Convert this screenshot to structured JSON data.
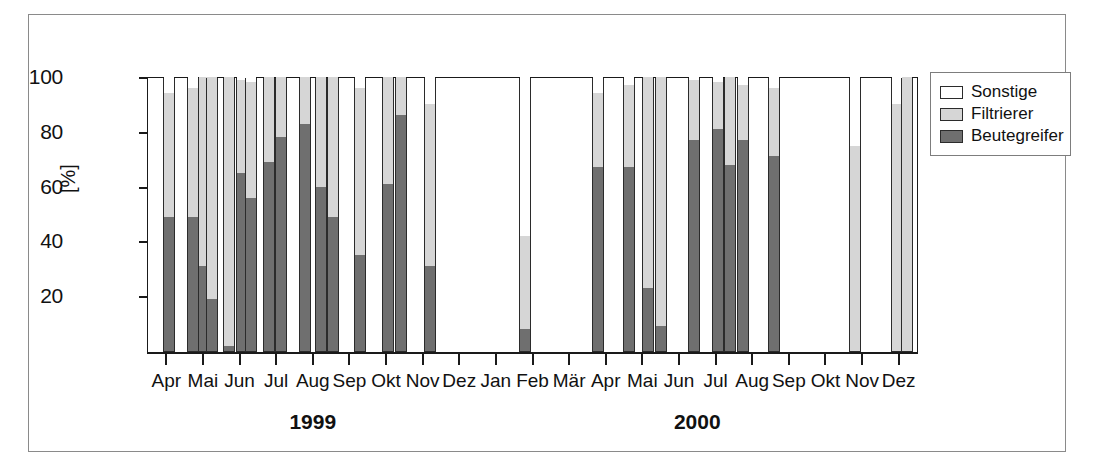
{
  "figure": {
    "axis": {
      "ylabel": "[%]",
      "yticks": [
        20,
        40,
        60,
        80,
        100
      ],
      "ymin": 0,
      "ymax": 100
    },
    "legend": {
      "items": [
        {
          "label": "Sonstige",
          "color": "#ffffff",
          "key": "sonstige"
        },
        {
          "label": "Filtrierer",
          "color": "#d6d6d6",
          "key": "filtrierer"
        },
        {
          "label": "Beutegreifer",
          "color": "#6f6f6f",
          "key": "beutegreifer"
        }
      ]
    },
    "year_groups": [
      {
        "label": "1999",
        "start_month": "Apr",
        "end_month": "Dez"
      },
      {
        "label": "2000",
        "start_month": "Jan",
        "end_month": "Dez"
      }
    ]
  },
  "chart_data": {
    "type": "bar",
    "subtype": "stacked-percentage",
    "title": "",
    "xlabel": "",
    "ylabel": "[%]",
    "ylim": [
      0,
      100
    ],
    "grid": false,
    "legend_position": "right",
    "series": [
      {
        "name": "Beutegreifer",
        "color": "#6f6f6f"
      },
      {
        "name": "Filtrierer",
        "color": "#d6d6d6"
      },
      {
        "name": "Sonstige",
        "color": "#ffffff"
      }
    ],
    "categories": [
      "Apr",
      "Mai",
      "Jun",
      "Jul",
      "Aug",
      "Sep",
      "Okt",
      "Nov",
      "Dez",
      "Jan",
      "Feb",
      "Mär",
      "Apr",
      "Mai",
      "Jun",
      "Jul",
      "Aug",
      "Sep",
      "Okt",
      "Nov",
      "Dez"
    ],
    "category_years": [
      "1999",
      "1999",
      "1999",
      "1999",
      "1999",
      "1999",
      "1999",
      "1999",
      "1999",
      "2000",
      "2000",
      "2000",
      "2000",
      "2000",
      "2000",
      "2000",
      "2000",
      "2000",
      "2000",
      "2000",
      "2000"
    ],
    "samples": [
      {
        "month": "Apr",
        "year": "1999",
        "x": 0.06,
        "beutegreifer": 49,
        "filtrierer": 45,
        "sonstige": 6
      },
      {
        "month": "Mai",
        "year": "1999",
        "x": 0.72,
        "beutegreifer": 49,
        "filtrierer": 47,
        "sonstige": 4
      },
      {
        "month": "Mai",
        "year": "1999",
        "x": 1.02,
        "beutegreifer": 31,
        "filtrierer": 69,
        "sonstige": 0
      },
      {
        "month": "Mai",
        "year": "1999",
        "x": 1.26,
        "beutegreifer": 19,
        "filtrierer": 81,
        "sonstige": 0
      },
      {
        "month": "Jun",
        "year": "1999",
        "x": 1.72,
        "beutegreifer": 2,
        "filtrierer": 98,
        "sonstige": 0
      },
      {
        "month": "Jun",
        "year": "1999",
        "x": 2.06,
        "beutegreifer": 65,
        "filtrierer": 34,
        "sonstige": 1
      },
      {
        "month": "Jun",
        "year": "1999",
        "x": 2.3,
        "beutegreifer": 56,
        "filtrierer": 42,
        "sonstige": 2
      },
      {
        "month": "Jul",
        "year": "1999",
        "x": 2.8,
        "beutegreifer": 69,
        "filtrierer": 31,
        "sonstige": 0
      },
      {
        "month": "Jul",
        "year": "1999",
        "x": 3.14,
        "beutegreifer": 78,
        "filtrierer": 22,
        "sonstige": 0
      },
      {
        "month": "Aug",
        "year": "1999",
        "x": 3.8,
        "beutegreifer": 83,
        "filtrierer": 17,
        "sonstige": 0
      },
      {
        "month": "Aug",
        "year": "1999",
        "x": 4.22,
        "beutegreifer": 60,
        "filtrierer": 40,
        "sonstige": 0
      },
      {
        "month": "Sep",
        "year": "1999",
        "x": 4.56,
        "beutegreifer": 49,
        "filtrierer": 51,
        "sonstige": 0
      },
      {
        "month": "Sep",
        "year": "1999",
        "x": 5.3,
        "beutegreifer": 35,
        "filtrierer": 61,
        "sonstige": 4
      },
      {
        "month": "Okt",
        "year": "1999",
        "x": 6.06,
        "beutegreifer": 61,
        "filtrierer": 39,
        "sonstige": 0
      },
      {
        "month": "Nov",
        "year": "1999",
        "x": 6.42,
        "beutegreifer": 86,
        "filtrierer": 14,
        "sonstige": 0
      },
      {
        "month": "Nov",
        "year": "1999",
        "x": 7.2,
        "beutegreifer": 31,
        "filtrierer": 59,
        "sonstige": 10
      },
      {
        "month": "Feb",
        "year": "2000",
        "x": 9.8,
        "beutegreifer": 8,
        "filtrierer": 34,
        "sonstige": 58
      },
      {
        "month": "Apr",
        "year": "2000",
        "x": 11.8,
        "beutegreifer": 67,
        "filtrierer": 27,
        "sonstige": 6
      },
      {
        "month": "Apr",
        "year": "2000",
        "x": 12.64,
        "beutegreifer": 67,
        "filtrierer": 30,
        "sonstige": 3
      },
      {
        "month": "Mai",
        "year": "2000",
        "x": 13.16,
        "beutegreifer": 23,
        "filtrierer": 77,
        "sonstige": 0
      },
      {
        "month": "Mai",
        "year": "2000",
        "x": 13.52,
        "beutegreifer": 9,
        "filtrierer": 91,
        "sonstige": 0
      },
      {
        "month": "Jun",
        "year": "2000",
        "x": 14.42,
        "beutegreifer": 77,
        "filtrierer": 22,
        "sonstige": 1
      },
      {
        "month": "Jul",
        "year": "2000",
        "x": 15.06,
        "beutegreifer": 81,
        "filtrierer": 17,
        "sonstige": 2
      },
      {
        "month": "Jul",
        "year": "2000",
        "x": 15.4,
        "beutegreifer": 68,
        "filtrierer": 32,
        "sonstige": 0
      },
      {
        "month": "Aug",
        "year": "2000",
        "x": 15.76,
        "beutegreifer": 77,
        "filtrierer": 20,
        "sonstige": 3
      },
      {
        "month": "Sep",
        "year": "2000",
        "x": 16.6,
        "beutegreifer": 71,
        "filtrierer": 25,
        "sonstige": 4
      },
      {
        "month": "Nov",
        "year": "2000",
        "x": 18.82,
        "beutegreifer": 0,
        "filtrierer": 75,
        "sonstige": 25
      },
      {
        "month": "Dez",
        "year": "2000",
        "x": 19.96,
        "beutegreifer": 0,
        "filtrierer": 90,
        "sonstige": 10
      },
      {
        "month": "Dez",
        "year": "2000",
        "x": 20.24,
        "beutegreifer": 0,
        "filtrierer": 100,
        "sonstige": 0
      }
    ],
    "empty_months": [
      "Jan 2000",
      "Mär 2000",
      "Okt 2000"
    ],
    "annotations": []
  }
}
